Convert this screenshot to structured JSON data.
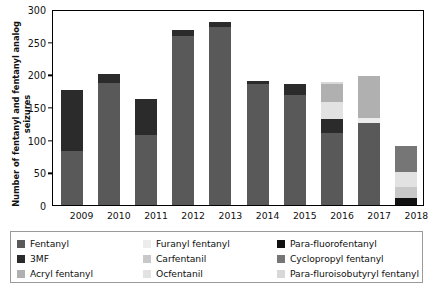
{
  "chart_data": {
    "type": "bar",
    "title": "",
    "subtitle": "",
    "stacked": true,
    "xlabel": "",
    "ylabel": "Number of fentanyl and fentanyl analog seizures",
    "ylabel_lines": [
      "Number of fentanyl and fentanyl analog",
      "seizures"
    ],
    "categories": [
      "2009",
      "2010",
      "2011",
      "2012",
      "2013",
      "2014",
      "2015",
      "2016",
      "2017",
      "2018"
    ],
    "ylim": [
      0,
      300
    ],
    "yticks": [
      0,
      50,
      100,
      150,
      200,
      250,
      300
    ],
    "grid": false,
    "legend_position": "bottom",
    "series": [
      {
        "name": "Fentanyl",
        "color": "#595959",
        "values": [
          82,
          186,
          107,
          259,
          272,
          185,
          168,
          110,
          126,
          0
        ]
      },
      {
        "name": "3MF",
        "color": "#2b2b2b",
        "values": [
          94,
          15,
          56,
          9,
          8,
          5,
          17,
          22,
          0,
          0
        ]
      },
      {
        "name": "Acryl fentanyl",
        "color": "#b0b0b0",
        "values": [
          0,
          0,
          0,
          0,
          0,
          0,
          0,
          28,
          64,
          0
        ]
      },
      {
        "name": "Furanyl fentanyl",
        "color": "#ececec",
        "values": [
          0,
          0,
          0,
          0,
          0,
          0,
          0,
          0,
          7,
          0
        ]
      },
      {
        "name": "Carfentanil",
        "color": "#c8c8c8",
        "values": [
          0,
          0,
          0,
          0,
          0,
          0,
          0,
          0,
          0,
          18
        ]
      },
      {
        "name": "Ocfentanil",
        "color": "#e2e2e2",
        "values": [
          0,
          0,
          0,
          0,
          0,
          0,
          0,
          25,
          0,
          22
        ]
      },
      {
        "name": "Para-fluorofentanyl",
        "color": "#111111",
        "values": [
          0,
          0,
          0,
          0,
          0,
          0,
          0,
          0,
          0,
          10
        ]
      },
      {
        "name": "Cyclopropyl fentanyl",
        "color": "#767676",
        "values": [
          0,
          0,
          0,
          0,
          0,
          0,
          0,
          0,
          0,
          41
        ]
      },
      {
        "name": "Para-fluroisobutyryl fentanyl",
        "color": "#d8d8d8",
        "values": [
          0,
          0,
          0,
          0,
          0,
          0,
          0,
          3,
          0,
          0
        ]
      }
    ],
    "totals": [
      176,
      201,
      163,
      268,
      280,
      190,
      185,
      188,
      197,
      91
    ]
  },
  "legend": {
    "items": [
      {
        "label": "Fentanyl",
        "color": "#595959"
      },
      {
        "label": "3MF",
        "color": "#2b2b2b"
      },
      {
        "label": "Acryl fentanyl",
        "color": "#b0b0b0"
      },
      {
        "label": "Furanyl fentanyl",
        "color": "#ececec"
      },
      {
        "label": "Carfentanil",
        "color": "#c8c8c8"
      },
      {
        "label": "Ocfentanil",
        "color": "#e2e2e2"
      },
      {
        "label": "Para-fluorofentanyl",
        "color": "#111111"
      },
      {
        "label": "Cyclopropyl fentanyl",
        "color": "#767676"
      },
      {
        "label": "Para-fluroisobutyryl fentanyl",
        "color": "#d8d8d8"
      }
    ]
  }
}
